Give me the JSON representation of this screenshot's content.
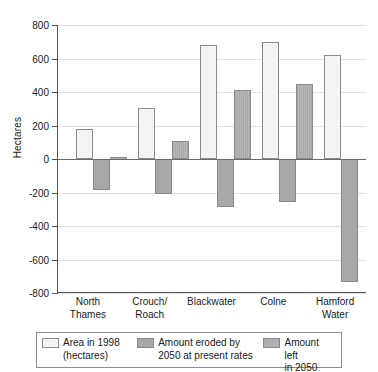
{
  "chart_data": {
    "type": "bar",
    "title": "",
    "subtitle": "",
    "xlabel": "",
    "ylabel": "Hectares",
    "ylim": [
      -800,
      800
    ],
    "ytick_step": 200,
    "yticks": [
      "800",
      "600",
      "400",
      "200",
      "0",
      "-200",
      "-400",
      "-600",
      "-800"
    ],
    "grid": true,
    "legend_position": "bottom",
    "categories": [
      "North\nThames",
      "Crouch/\nRoach",
      "Blackwater",
      "Colne",
      "Hamford\nWater"
    ],
    "series": [
      {
        "name": "Area in 1998\n(hectares)",
        "color": "#f4f4f2",
        "values": [
          180,
          305,
          680,
          700,
          620
        ]
      },
      {
        "name": "Amount eroded by\n2050 at present rates",
        "color": "#a8a8a8",
        "values": [
          -185,
          -210,
          -285,
          -255,
          -735
        ]
      },
      {
        "name": "Amount left\nin 2050",
        "color": "#b0b0b0",
        "values": [
          10,
          105,
          410,
          450,
          -735
        ]
      }
    ]
  },
  "axis": {
    "ylabel": "Hectares",
    "ticks": [
      {
        "value": 800,
        "label": "800"
      },
      {
        "value": 600,
        "label": "600"
      },
      {
        "value": 400,
        "label": "400"
      },
      {
        "value": 200,
        "label": "200"
      },
      {
        "value": 0,
        "label": "0"
      },
      {
        "value": -200,
        "label": "-200"
      },
      {
        "value": -400,
        "label": "-400"
      },
      {
        "value": -600,
        "label": "-600"
      },
      {
        "value": -800,
        "label": "-800"
      }
    ]
  },
  "xaxis": {
    "labels": [
      "North\nThames",
      "Crouch/\nRoach",
      "Blackwater",
      "Colne",
      "Hamford\nWater"
    ]
  },
  "legend": {
    "items": [
      {
        "label": "Area in 1998\n(hectares)",
        "swatch": "s1"
      },
      {
        "label": "Amount eroded by\n2050 at present rates",
        "swatch": "s2"
      },
      {
        "label": "Amount left\nin 2050",
        "swatch": "s3"
      }
    ]
  },
  "colors": {
    "series1": "#f4f4f2",
    "series2": "#a8a8a8",
    "series3": "#b0b0b0",
    "grid": "#e2e2e2",
    "axis": "#555555",
    "zero_line": "#6b6b6b"
  }
}
